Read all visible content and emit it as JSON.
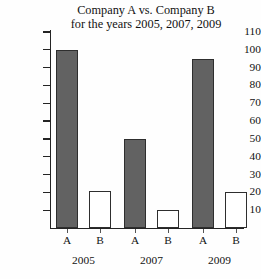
{
  "chart_data": {
    "type": "bar",
    "title": "Company A vs. Company B for the years 2005, 2007, 2009",
    "title_line1": "Company A vs. Company B",
    "title_line2": "for the years 2005, 2007, 2009",
    "xlabel": "",
    "ylabel": "",
    "ylim": [
      0,
      110
    ],
    "ytick_step": 10,
    "yticks": [
      110,
      100,
      90,
      80,
      70,
      60,
      50,
      40,
      30,
      20,
      10
    ],
    "ytick_labels": [
      "110",
      "100",
      "90",
      "80",
      "70",
      "60",
      "50",
      "40",
      "30",
      "20",
      "10"
    ],
    "grid": false,
    "legend": "none",
    "categories": [
      "2005",
      "2007",
      "2009"
    ],
    "series": [
      {
        "name": "A",
        "label": "A",
        "color": "#626262",
        "values": [
          100,
          50,
          95
        ]
      },
      {
        "name": "B",
        "label": "B",
        "color": "#ffffff",
        "values": [
          21,
          10,
          20
        ]
      }
    ],
    "bars": [
      {
        "group": "2005",
        "series": "A",
        "label": "A",
        "value": 100,
        "style": "dark"
      },
      {
        "group": "2005",
        "series": "B",
        "label": "B",
        "value": 21,
        "style": "light"
      },
      {
        "group": "2007",
        "series": "A",
        "label": "A",
        "value": 50,
        "style": "dark"
      },
      {
        "group": "2007",
        "series": "B",
        "label": "B",
        "value": 10,
        "style": "light"
      },
      {
        "group": "2009",
        "series": "A",
        "label": "A",
        "value": 95,
        "style": "dark"
      },
      {
        "group": "2009",
        "series": "B",
        "label": "B",
        "value": 20,
        "style": "light"
      }
    ],
    "colors": {
      "bar_dark": "#626262",
      "bar_light": "#ffffff",
      "bar_outline": "#2e2e2e",
      "axis": "#242424",
      "text": "#121212",
      "background": "#fefefe"
    }
  }
}
